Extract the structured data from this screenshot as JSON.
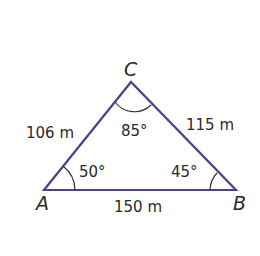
{
  "diagram": {
    "type": "triangle",
    "line_color": "#4b4288",
    "vertices": [
      {
        "name": "A",
        "label": "A",
        "angle": "50°"
      },
      {
        "name": "B",
        "label": "B",
        "angle": "45°"
      },
      {
        "name": "C",
        "label": "C",
        "angle": "85°"
      }
    ],
    "sides": [
      {
        "between": "AC",
        "label": "106 m"
      },
      {
        "between": "CB",
        "label": "115 m"
      },
      {
        "between": "AB",
        "label": "150 m"
      }
    ]
  }
}
